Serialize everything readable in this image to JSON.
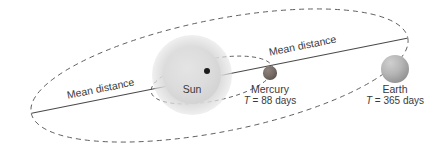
{
  "figure": {
    "width": 441,
    "height": 151,
    "background_color": "#ffffff"
  },
  "colors": {
    "orbit_line": "#5a5a5a",
    "axis_line": "#4a4a4a",
    "text": "#3a3a3a",
    "sun": "#dcdcdc",
    "mercury": "#6b615b",
    "earth": "#a8a8a8",
    "focus_dot": "#1c1c1c"
  },
  "labels": {
    "mean_distance_left": "Mean distance",
    "mean_distance_right": "Mean distance"
  },
  "bodies": {
    "sun": {
      "name": "Sun"
    },
    "mercury": {
      "name": "Mercury",
      "period_symbol": "T",
      "period_text": "= 88 days",
      "period_value": 88,
      "period_unit": "days"
    },
    "earth": {
      "name": "Earth",
      "period_symbol": "T",
      "period_text": "= 365 days",
      "period_value": 365,
      "period_unit": "days"
    }
  },
  "orbits": {
    "earth_orbit": {
      "style": "dashed",
      "body": "Earth"
    },
    "mercury_orbit": {
      "style": "dashed",
      "body": "Mercury"
    },
    "major_axis": {
      "style": "solid",
      "meaning": "Mean distance"
    }
  }
}
